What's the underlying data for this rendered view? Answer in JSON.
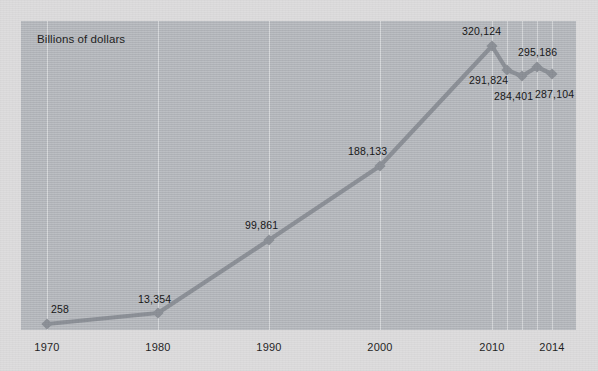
{
  "chart_data": {
    "type": "line",
    "title": "Billions of dollars",
    "xlabel": "",
    "ylabel": "",
    "grid": "vertical-only",
    "legend": "none",
    "xlim": [
      1970,
      2014
    ],
    "ylim": [
      0,
      340000
    ],
    "x": [
      1970,
      1980,
      1990,
      2000,
      2010,
      2011,
      2012,
      2013,
      2014
    ],
    "values": [
      258,
      13354,
      99861,
      188133,
      320124,
      291824,
      284401,
      295186,
      287104
    ],
    "point_labels": [
      "258",
      "13,354",
      "99,861",
      "188,133",
      "320,124",
      "291,824",
      "284,401",
      "295,186",
      "287,104"
    ],
    "tick_labels": [
      "1970",
      "1980",
      "1990",
      "2000",
      "2010",
      "2014"
    ],
    "tick_values": [
      1970,
      1980,
      1990,
      2000,
      2010,
      2014
    ],
    "series": [
      {
        "name": "Billions of dollars",
        "marker": "diamond",
        "values": [
          258,
          13354,
          99861,
          188133,
          320124,
          291824,
          284401,
          295186,
          287104
        ]
      }
    ],
    "colors": {
      "line": "#8b8f96",
      "marker": "#8b8f96",
      "plot_background": "#b6b9be",
      "page_background": "#dddcdd",
      "gridline": "#ffffff",
      "text": "#141414"
    }
  },
  "points": [
    {
      "label": "258",
      "x": 1970,
      "px": 26,
      "py": 303,
      "lx": 30,
      "ly": 282
    },
    {
      "label": "13,354",
      "x": 1980,
      "px": 137,
      "py": 292,
      "lx": 117,
      "ly": 272
    },
    {
      "label": "99,861",
      "x": 1990,
      "px": 248,
      "py": 219,
      "lx": 224,
      "ly": 198
    },
    {
      "label": "188,133",
      "x": 2000,
      "px": 359,
      "py": 145,
      "lx": 327,
      "ly": 124
    },
    {
      "label": "320,124",
      "x": 2010,
      "px": 471,
      "py": 25,
      "lx": 441,
      "ly": 4
    },
    {
      "label": "291,824",
      "x": 2011,
      "px": 486,
      "py": 49,
      "lx": 448,
      "ly": 53
    },
    {
      "label": "284,401",
      "x": 2012,
      "px": 501,
      "py": 55,
      "lx": 473,
      "ly": 69
    },
    {
      "label": "295,186",
      "x": 2013,
      "px": 516,
      "py": 46,
      "lx": 497,
      "ly": 25
    },
    {
      "label": "287,104",
      "x": 2014,
      "px": 531,
      "py": 53,
      "lx": 514,
      "ly": 67
    }
  ],
  "gridlines_px": [
    26,
    137,
    248,
    359,
    471,
    486,
    501,
    516,
    531
  ],
  "xticks": [
    {
      "label": "1970",
      "px": 47
    },
    {
      "label": "1980",
      "px": 158
    },
    {
      "label": "1990",
      "px": 269
    },
    {
      "label": "2000",
      "px": 380
    },
    {
      "label": "2010",
      "px": 492
    },
    {
      "label": "2014",
      "px": 552
    }
  ]
}
